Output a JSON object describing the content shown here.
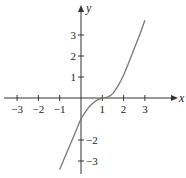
{
  "chart_data": {
    "type": "line",
    "title": "",
    "xlabel": "x",
    "ylabel": "y",
    "xlim": [
      -3.8,
      4.5
    ],
    "ylim": [
      -3.8,
      4.4
    ],
    "grid": false,
    "legend": null,
    "x_ticks": [
      -3,
      -2,
      -1,
      1,
      2,
      3
    ],
    "y_ticks": [
      -3,
      -2,
      1,
      2,
      3
    ],
    "x_tick_labels": [
      "−3",
      "−2",
      "−1",
      "1",
      "2",
      "3"
    ],
    "y_tick_labels": [
      "−3",
      "−2",
      "1",
      "2",
      "3"
    ],
    "series": [
      {
        "name": "f(x)",
        "color": "#777777",
        "x": [
          -1.0,
          -0.75,
          -0.5,
          -0.25,
          0.0,
          0.25,
          0.5,
          0.75,
          1.0,
          1.15,
          1.3,
          1.5,
          1.75,
          2.0,
          2.25,
          2.5,
          2.75,
          3.0
        ],
        "y": [
          -3.4,
          -2.8,
          -2.2,
          -1.6,
          -1.0,
          -0.6,
          -0.3,
          -0.1,
          0.0,
          0.02,
          0.07,
          0.22,
          0.6,
          1.1,
          1.7,
          2.35,
          3.0,
          3.7
        ]
      }
    ]
  },
  "axes": {
    "x_label": "x",
    "y_label": "y"
  }
}
